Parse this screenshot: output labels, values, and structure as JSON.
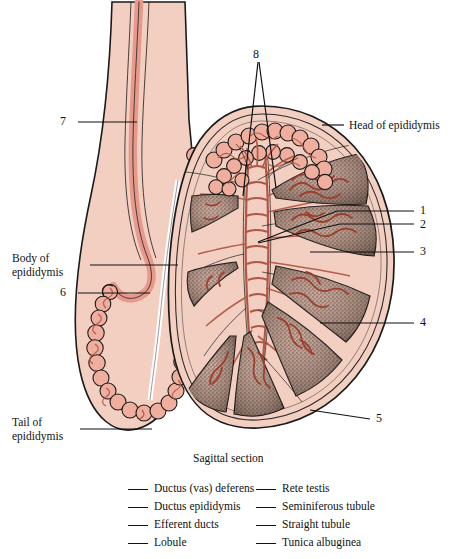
{
  "figure": {
    "title_caption": "Sagittal section",
    "colors": {
      "tissue_fill": "#F3CFC2",
      "duct_fill": "#E79A8B",
      "outline": "#1a1a1a",
      "lobule_dark": "#4a3630",
      "tubule_line": "#8d3b2e",
      "background": "#ffffff"
    }
  },
  "callouts": {
    "head_of_epididymis": "Head of epididymis",
    "body_of_epididymis_line1": "Body of",
    "body_of_epididymis_line2": "epididymis",
    "tail_of_epididymis_line1": "Tail of",
    "tail_of_epididymis_line2": "epididymis"
  },
  "numbers": {
    "n1": "1",
    "n2": "2",
    "n3": "3",
    "n4": "4",
    "n5": "5",
    "n6": "6",
    "n7": "7",
    "n8": "8"
  },
  "legend": {
    "left_column": [
      "Ductus (vas) deferens",
      "Ductus epididymis",
      "Efferent ducts",
      "Lobule"
    ],
    "right_column": [
      "Rete testis",
      "Seminiferous tubule",
      "Straight tubule",
      "Tunica albuginea"
    ]
  }
}
